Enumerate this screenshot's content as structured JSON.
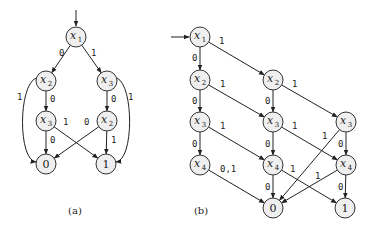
{
  "figure": {
    "diagrams": [
      {
        "id": "a",
        "caption": "(a)",
        "caption_pos": [
          75,
          214
        ],
        "entry_arrow": {
          "from": [
            76,
            10
          ],
          "to": [
            76,
            26
          ]
        },
        "nodes": [
          {
            "id": "a_x1",
            "var": "x",
            "sub": "1",
            "cx": 76,
            "cy": 37,
            "terminal": false
          },
          {
            "id": "a_x2",
            "var": "x",
            "sub": "2",
            "cx": 46,
            "cy": 81,
            "terminal": false
          },
          {
            "id": "a_x3r",
            "var": "x",
            "sub": "3",
            "cx": 107,
            "cy": 81,
            "terminal": false
          },
          {
            "id": "a_x3l",
            "var": "x",
            "sub": "3",
            "cx": 46,
            "cy": 121,
            "terminal": false
          },
          {
            "id": "a_x2r",
            "var": "x",
            "sub": "2",
            "cx": 107,
            "cy": 121,
            "terminal": false
          },
          {
            "id": "a_t0",
            "label": "0",
            "cx": 46,
            "cy": 164,
            "terminal": true
          },
          {
            "id": "a_t1",
            "label": "1",
            "cx": 106,
            "cy": 164,
            "terminal": true
          }
        ],
        "edges": [
          {
            "from": "a_x1",
            "to": "a_x2",
            "label": "0",
            "label_pos": [
              59,
              56
            ]
          },
          {
            "from": "a_x1",
            "to": "a_x3r",
            "label": "1",
            "label_pos": [
              91,
              56
            ]
          },
          {
            "from": "a_x2",
            "to": "a_x3l",
            "label": "0",
            "label_pos": [
              50,
              102
            ]
          },
          {
            "from": "a_x3r",
            "to": "a_x2r",
            "label": "0",
            "label_pos": [
              111,
              102
            ]
          },
          {
            "from": "a_x3l",
            "to": "a_t0",
            "label": "0",
            "label_pos": [
              50,
              143
            ]
          },
          {
            "from": "a_x3l",
            "to": "a_t1",
            "label": "1",
            "label_pos": [
              63,
              125
            ]
          },
          {
            "from": "a_x2r",
            "to": "a_t0",
            "label": "0",
            "label_pos": [
              84,
              125
            ]
          },
          {
            "from": "a_x2r",
            "to": "a_t1",
            "label": "1",
            "label_pos": [
              111,
              143
            ]
          },
          {
            "from": "a_x2",
            "to": "a_t0",
            "label": "1",
            "label_pos": [
              17,
              100
            ],
            "curve": "M36,78 C18,86 18,160 36,162"
          },
          {
            "from": "a_x3r",
            "to": "a_t1",
            "label": "1",
            "label_pos": [
              128,
              100
            ],
            "curve": "M117,78 C134,86 134,160 116,162"
          }
        ]
      },
      {
        "id": "b",
        "caption": "(b)",
        "caption_pos": [
          201,
          214
        ],
        "entry_arrow": {
          "from": [
            171,
            37
          ],
          "to": [
            189,
            37
          ]
        },
        "nodes": [
          {
            "id": "b_x1",
            "var": "x",
            "sub": "1",
            "cx": 200,
            "cy": 37,
            "terminal": false
          },
          {
            "id": "b_x2a",
            "var": "x",
            "sub": "2",
            "cx": 200,
            "cy": 80,
            "terminal": false
          },
          {
            "id": "b_x2b",
            "var": "x",
            "sub": "2",
            "cx": 273,
            "cy": 80,
            "terminal": false
          },
          {
            "id": "b_x3a",
            "var": "x",
            "sub": "3",
            "cx": 200,
            "cy": 122,
            "terminal": false
          },
          {
            "id": "b_x3b",
            "var": "x",
            "sub": "3",
            "cx": 273,
            "cy": 122,
            "terminal": false
          },
          {
            "id": "b_x3c",
            "var": "x",
            "sub": "3",
            "cx": 346,
            "cy": 122,
            "terminal": false
          },
          {
            "id": "b_x4a",
            "var": "x",
            "sub": "4",
            "cx": 200,
            "cy": 165,
            "terminal": false
          },
          {
            "id": "b_x4b",
            "var": "x",
            "sub": "4",
            "cx": 273,
            "cy": 165,
            "terminal": false
          },
          {
            "id": "b_x4c",
            "var": "x",
            "sub": "4",
            "cx": 346,
            "cy": 165,
            "terminal": false
          },
          {
            "id": "b_t0",
            "label": "0",
            "cx": 273,
            "cy": 208,
            "terminal": true
          },
          {
            "id": "b_t1",
            "label": "1",
            "cx": 345,
            "cy": 208,
            "terminal": true
          }
        ],
        "edges": [
          {
            "from": "b_x1",
            "to": "b_x2a",
            "label": "0",
            "label_pos": [
              192,
              61
            ]
          },
          {
            "from": "b_x1",
            "to": "b_x2b",
            "label": "1",
            "label_pos": [
              219,
              44
            ]
          },
          {
            "from": "b_x2a",
            "to": "b_x3a",
            "label": "0",
            "label_pos": [
              192,
              104
            ]
          },
          {
            "from": "b_x2a",
            "to": "b_x3b",
            "label": "1",
            "label_pos": [
              220,
              87
            ]
          },
          {
            "from": "b_x2b",
            "to": "b_x3b",
            "label": "0",
            "label_pos": [
              265,
              104
            ]
          },
          {
            "from": "b_x2b",
            "to": "b_x3c",
            "label": "1",
            "label_pos": [
              292,
              87
            ]
          },
          {
            "from": "b_x3a",
            "to": "b_x4a",
            "label": "0",
            "label_pos": [
              192,
              147
            ]
          },
          {
            "from": "b_x3a",
            "to": "b_x4b",
            "label": "1",
            "label_pos": [
              220,
              129
            ]
          },
          {
            "from": "b_x3b",
            "to": "b_x4b",
            "label": "0",
            "label_pos": [
              265,
              147
            ]
          },
          {
            "from": "b_x3b",
            "to": "b_x4c",
            "label": "1",
            "label_pos": [
              292,
              129
            ]
          },
          {
            "from": "b_x3c",
            "to": "b_x4c",
            "label": "0",
            "label_pos": [
              338,
              147
            ]
          },
          {
            "from": "b_x3c",
            "to": "b_t0",
            "label": "1",
            "label_pos": [
              322,
              139
            ]
          },
          {
            "from": "b_x4a",
            "to": "b_t0",
            "label": "0,1",
            "label_pos": [
              220,
              172
            ]
          },
          {
            "from": "b_x4b",
            "to": "b_t0",
            "label": "0",
            "label_pos": [
              265,
              190
            ]
          },
          {
            "from": "b_x4b",
            "to": "b_t1",
            "label": "1",
            "label_pos": [
              290,
              172
            ]
          },
          {
            "from": "b_x4c",
            "to": "b_t0",
            "label": "1",
            "label_pos": [
              315,
              179
            ]
          },
          {
            "from": "b_x4c",
            "to": "b_t1",
            "label": "0",
            "label_pos": [
              338,
              190
            ]
          }
        ]
      }
    ]
  },
  "style": {
    "node_fill": "#efefef",
    "node_stroke": "#333333",
    "edge_color": "#222222",
    "node_radius": 10
  }
}
